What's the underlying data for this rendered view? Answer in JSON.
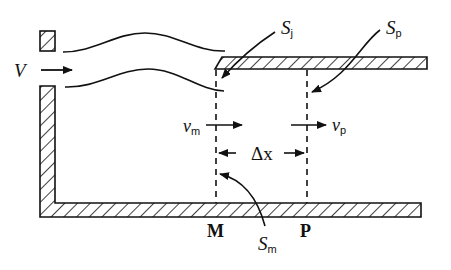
{
  "figure": {
    "type": "schematic",
    "colors": {
      "ink": "#111111",
      "background": "#ffffff"
    }
  },
  "labels": {
    "inlet_velocity": "V",
    "section_j": {
      "main": "S",
      "sub": "j"
    },
    "section_p": {
      "main": "S",
      "sub": "p"
    },
    "section_m": {
      "main": "S",
      "sub": "m"
    },
    "velocity_m": {
      "main": "v",
      "sub": "m"
    },
    "velocity_p": {
      "main": "v",
      "sub": "p"
    },
    "delta_x": "Δx",
    "point_m": "M",
    "point_p": "P"
  }
}
